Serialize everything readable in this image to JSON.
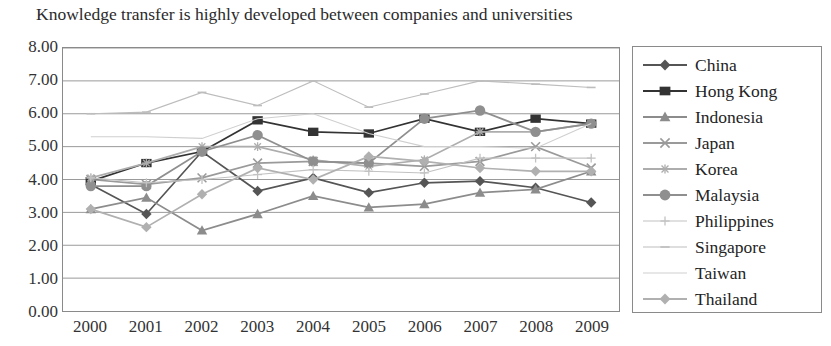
{
  "chart_data": {
    "type": "line",
    "title": "Knowledge transfer is highly developed between companies and universities",
    "xlabel": "",
    "ylabel": "",
    "ylim": [
      0,
      8
    ],
    "ytick_step": 1,
    "ytick_labels": [
      "8.00",
      "7.00",
      "6.00",
      "5.00",
      "4.00",
      "3.00",
      "2.00",
      "1.00",
      "0.00"
    ],
    "grid": true,
    "legend_position": "right",
    "categories": [
      "2000",
      "2001",
      "2002",
      "2003",
      "2004",
      "2005",
      "2006",
      "2007",
      "2008",
      "2009"
    ],
    "series": [
      {
        "name": "China",
        "marker": "diamond",
        "color": "#555555",
        "values": [
          3.85,
          2.95,
          4.85,
          3.65,
          4.05,
          3.6,
          3.9,
          3.95,
          3.75,
          3.3
        ]
      },
      {
        "name": "Hong Kong",
        "marker": "square",
        "color": "#333333",
        "values": [
          3.95,
          4.5,
          4.85,
          5.8,
          5.45,
          5.4,
          5.85,
          5.45,
          5.85,
          5.7
        ]
      },
      {
        "name": "Indonesia",
        "marker": "triangle",
        "color": "#8c8c8c",
        "values": [
          3.1,
          3.45,
          2.45,
          2.95,
          3.5,
          3.15,
          3.25,
          3.6,
          3.7,
          4.25
        ]
      },
      {
        "name": "Japan",
        "marker": "x",
        "color": "#9a9a9a",
        "values": [
          4.0,
          3.85,
          4.05,
          4.5,
          4.55,
          4.5,
          4.4,
          4.55,
          5.0,
          4.35
        ]
      },
      {
        "name": "Korea",
        "marker": "asterisk",
        "color": "#adadad",
        "values": [
          4.05,
          4.5,
          5.0,
          5.0,
          4.6,
          4.4,
          4.6,
          5.45,
          5.45,
          5.7
        ]
      },
      {
        "name": "Malaysia",
        "marker": "circle",
        "color": "#8f8f8f",
        "values": [
          3.8,
          3.8,
          4.85,
          5.35,
          4.55,
          4.5,
          5.85,
          6.1,
          5.45,
          5.7
        ]
      },
      {
        "name": "Philippines",
        "marker": "plus",
        "color": "#c2c2c2",
        "values": [
          4.05,
          3.9,
          4.0,
          4.15,
          4.3,
          4.25,
          4.2,
          4.65,
          4.65,
          4.65
        ]
      },
      {
        "name": "Singapore",
        "marker": "dash",
        "color": "#bdbdbd",
        "values": [
          6.0,
          6.05,
          6.65,
          6.25,
          7.0,
          6.2,
          6.6,
          7.0,
          6.9,
          6.8
        ]
      },
      {
        "name": "Taiwan",
        "marker": "line",
        "color": "#cfcfcf",
        "values": [
          5.3,
          5.3,
          5.25,
          5.85,
          6.0,
          5.4,
          5.0,
          5.0,
          4.95,
          5.7
        ]
      },
      {
        "name": "Thailand",
        "marker": "diamond",
        "color": "#b0b0b0",
        "values": [
          3.1,
          2.55,
          3.55,
          4.35,
          4.0,
          4.7,
          4.55,
          4.35,
          4.25,
          4.25
        ]
      }
    ]
  }
}
